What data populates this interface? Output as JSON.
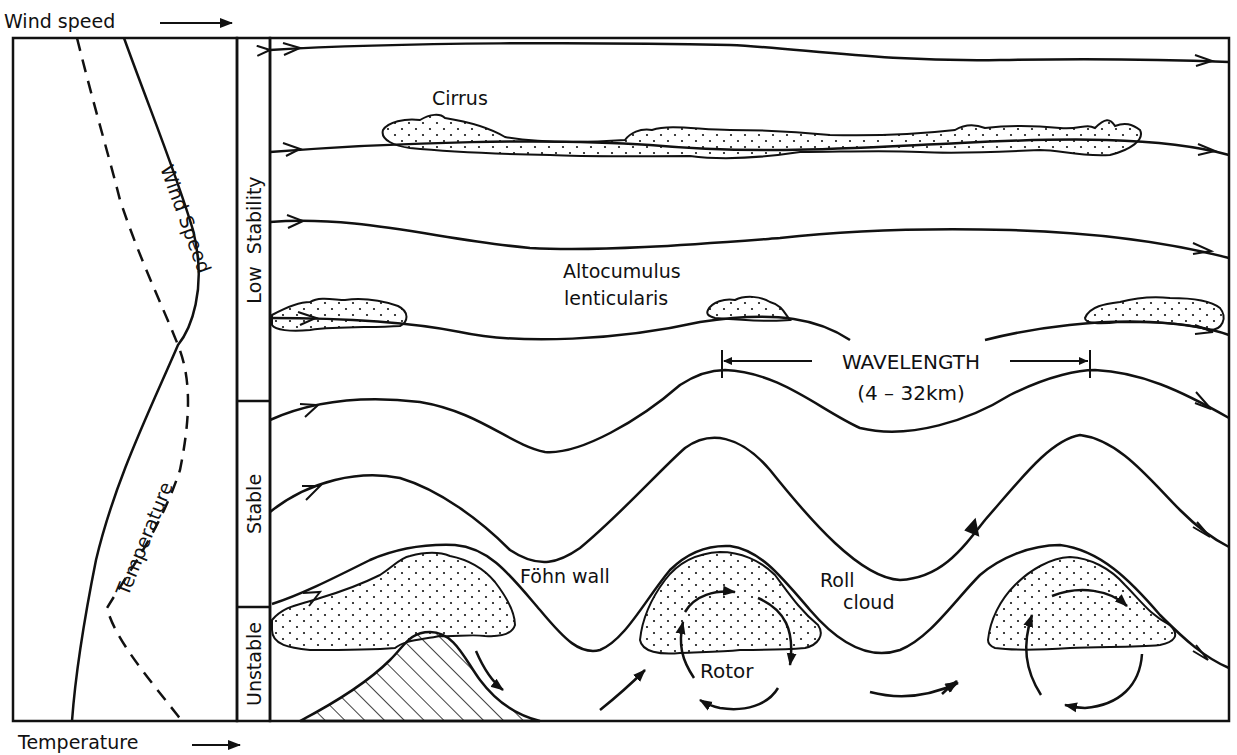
{
  "axes": {
    "top_label": "Wind speed",
    "bottom_label": "Temperature"
  },
  "profile": {
    "wind_speed_curve_label": "Wind Speed",
    "temperature_curve_label": "Temperature"
  },
  "stability_layers": [
    {
      "label": "Low  Stability"
    },
    {
      "label": "Stable"
    },
    {
      "label": "Unstable"
    }
  ],
  "cloud_labels": {
    "cirrus": "Cirrus",
    "altocumulus_line1": "Altocumulus",
    "altocumulus_line2": "lenticularis",
    "fohn_wall": "Föhn wall",
    "roll_line1": "Roll",
    "roll_line2": "cloud",
    "rotor": "Rotor"
  },
  "wavelength": {
    "label": "WAVELENGTH",
    "range": "(4 – 32km)"
  },
  "colors": {
    "ink": "#111111",
    "background": "#ffffff",
    "cloud_fill": "#ffffff"
  }
}
